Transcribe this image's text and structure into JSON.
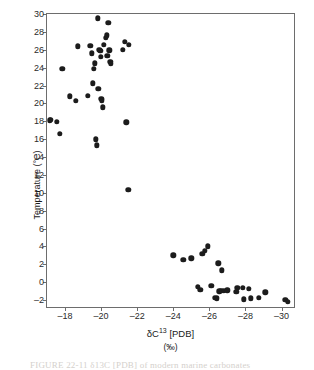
{
  "figure": {
    "caption": "FIGURE 22-11    δ13C [PDB] of modern marine carbonates"
  },
  "chart_data": {
    "type": "scatter",
    "title": "",
    "xlabel": "δC13 [PDB]",
    "xlabel_main": "δC",
    "xlabel_sup": "13",
    "xlabel_tail": " [PDB]",
    "xunits": "(‰)",
    "ylabel": "Temperature (°C)",
    "xlim": [
      -17.0,
      -30.8
    ],
    "ylim": [
      -3.0,
      30.0
    ],
    "xticks": [
      -18,
      -20,
      -22,
      -24,
      -26,
      -28,
      -30
    ],
    "xticklabels": [
      "–18",
      "–20",
      "–22",
      "–24",
      "–26",
      "–28",
      "–30"
    ],
    "yticks": [
      30,
      28,
      26,
      24,
      22,
      20,
      18,
      16,
      14,
      12,
      10,
      8,
      6,
      4,
      2,
      0,
      -2
    ],
    "yticklabels": [
      "30",
      "28",
      "26",
      "24",
      "22",
      "20",
      "18",
      "16",
      "14",
      "12",
      "10",
      "8",
      "6",
      "4",
      "2",
      "0",
      "–2"
    ],
    "grid": false,
    "legend": false,
    "marker": "filled-circle",
    "marker_color": "#1c1c1c",
    "frame_color": "#6d6d6d",
    "background": "#ffffff",
    "points": [
      [
        -17.15,
        18.1
      ],
      [
        -17.2,
        18.15
      ],
      [
        -17.55,
        17.95
      ],
      [
        -17.7,
        16.6
      ],
      [
        -17.85,
        23.9
      ],
      [
        -18.25,
        20.8
      ],
      [
        -18.6,
        20.3
      ],
      [
        -18.7,
        26.4
      ],
      [
        -19.25,
        20.85
      ],
      [
        -19.4,
        26.45
      ],
      [
        -19.5,
        25.6
      ],
      [
        -19.55,
        22.25
      ],
      [
        -19.6,
        23.85
      ],
      [
        -19.65,
        24.5
      ],
      [
        -19.7,
        16.0
      ],
      [
        -19.75,
        15.3
      ],
      [
        -19.8,
        29.5
      ],
      [
        -19.85,
        21.65
      ],
      [
        -19.9,
        26.0
      ],
      [
        -19.95,
        25.9
      ],
      [
        -19.98,
        25.2
      ],
      [
        -20.0,
        20.5
      ],
      [
        -20.05,
        20.35
      ],
      [
        -20.1,
        19.55
      ],
      [
        -20.15,
        26.55
      ],
      [
        -20.25,
        27.35
      ],
      [
        -20.3,
        27.6
      ],
      [
        -20.35,
        25.3
      ],
      [
        -20.4,
        29.0
      ],
      [
        -20.45,
        25.95
      ],
      [
        -20.5,
        24.65
      ],
      [
        -20.55,
        24.4
      ],
      [
        -21.2,
        26.0
      ],
      [
        -21.3,
        26.9
      ],
      [
        -21.55,
        26.55
      ],
      [
        -21.4,
        17.9
      ],
      [
        -21.5,
        10.3
      ],
      [
        -24.0,
        3.0
      ],
      [
        -24.55,
        2.5
      ],
      [
        -25.0,
        2.65
      ],
      [
        -25.6,
        3.2
      ],
      [
        -25.75,
        3.5
      ],
      [
        -25.9,
        4.0
      ],
      [
        -25.35,
        -0.55
      ],
      [
        -25.5,
        -0.85
      ],
      [
        -26.1,
        -0.4
      ],
      [
        -26.3,
        -1.75
      ],
      [
        -26.4,
        -1.8
      ],
      [
        -26.5,
        2.1
      ],
      [
        -26.7,
        1.35
      ],
      [
        -26.55,
        -1.0
      ],
      [
        -26.65,
        -0.95
      ],
      [
        -26.8,
        -0.95
      ],
      [
        -27.0,
        -0.9
      ],
      [
        -27.55,
        -0.65
      ],
      [
        -27.5,
        -1.1
      ],
      [
        -27.85,
        -0.6
      ],
      [
        -27.9,
        -1.9
      ],
      [
        -28.2,
        -0.75
      ],
      [
        -28.3,
        -1.8
      ],
      [
        -28.75,
        -1.75
      ],
      [
        -29.1,
        -1.15
      ],
      [
        -30.2,
        -1.95
      ],
      [
        -30.35,
        -2.2
      ]
    ]
  }
}
